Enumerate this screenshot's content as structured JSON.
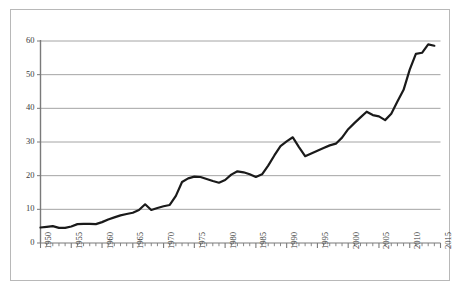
{
  "chart_data": {
    "type": "line",
    "title": "",
    "subtitle": "",
    "xlabel": "",
    "ylabel": "",
    "xlim": [
      1950,
      2015
    ],
    "ylim": [
      0,
      60
    ],
    "grid": "horizontal",
    "legend": "none",
    "y_ticks": [
      0,
      10,
      20,
      30,
      40,
      50,
      60
    ],
    "y_tick_labels": [
      "0",
      "10",
      "20",
      "30",
      "40",
      "50",
      "60"
    ],
    "x_major_ticks": [
      1950,
      1955,
      1960,
      1965,
      1970,
      1975,
      1980,
      1985,
      1990,
      1995,
      2000,
      2005,
      2010,
      2015
    ],
    "x_major_tick_labels": [
      "1950",
      "1955",
      "1960",
      "1965",
      "1970",
      "1975",
      "1980",
      "1985",
      "1990",
      "1995",
      "2000",
      "2005",
      "2010",
      "2015"
    ],
    "x_minor_tick_interval": 1,
    "line_color": "#1a1a1a",
    "line_width": 2.2,
    "grid_color": "#9a9a9a",
    "axis_color": "#7a7a7a",
    "series": [
      {
        "name": "series-1",
        "x": [
          1950,
          1951,
          1952,
          1953,
          1954,
          1955,
          1956,
          1957,
          1958,
          1959,
          1960,
          1961,
          1962,
          1963,
          1964,
          1965,
          1966,
          1967,
          1968,
          1969,
          1970,
          1971,
          1972,
          1973,
          1974,
          1975,
          1976,
          1977,
          1978,
          1979,
          1980,
          1981,
          1982,
          1983,
          1984,
          1985,
          1986,
          1987,
          1988,
          1989,
          1990,
          1991,
          1992,
          1993,
          1994,
          1995,
          1996,
          1997,
          1998,
          1999,
          2000,
          2001,
          2002,
          2003,
          2004,
          2005,
          2006,
          2007,
          2008,
          2009,
          2010,
          2011,
          2012,
          2013,
          2014
        ],
        "values": [
          4.6,
          4.8,
          5.0,
          4.5,
          4.5,
          4.9,
          5.6,
          5.7,
          5.7,
          5.6,
          6.2,
          7.0,
          7.6,
          8.2,
          8.6,
          9.0,
          9.8,
          11.5,
          9.8,
          10.4,
          10.9,
          11.3,
          14.0,
          18.1,
          19.2,
          19.7,
          19.6,
          19.0,
          18.4,
          17.9,
          18.7,
          20.3,
          21.3,
          21.0,
          20.4,
          19.6,
          20.4,
          23.0,
          26.0,
          28.8,
          30.2,
          31.4,
          28.5,
          25.8,
          26.6,
          27.4,
          28.2,
          29.0,
          29.5,
          31.3,
          33.8,
          35.6,
          37.3,
          39.0,
          38.0,
          37.6,
          36.5,
          38.4,
          42.0,
          45.5,
          51.5,
          56.2,
          56.5,
          59.0,
          58.6
        ]
      }
    ]
  },
  "axes": {
    "y_label_texts": [
      "60",
      "50",
      "40",
      "30",
      "20",
      "10",
      "0"
    ],
    "x_label_texts": [
      "1950",
      "1955",
      "1960",
      "1965",
      "1970",
      "1975",
      "1980",
      "1985",
      "1990",
      "1995",
      "2000",
      "2005",
      "2010",
      "2015"
    ]
  }
}
